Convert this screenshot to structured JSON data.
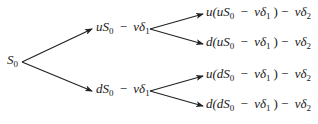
{
  "diagram": {
    "type": "binomial-tree",
    "root": {
      "label": "S0",
      "parts": [
        "S",
        "0"
      ]
    },
    "level1": [
      {
        "id": "up",
        "parts": [
          "uS",
          "0",
          " − ",
          "vδ",
          "1"
        ]
      },
      {
        "id": "down",
        "parts": [
          "dS",
          "0",
          " − ",
          "vδ",
          "1"
        ]
      }
    ],
    "level2": [
      {
        "id": "up-up",
        "parts": [
          "u(uS",
          "0",
          " − ",
          "vδ",
          "1",
          ") − ",
          "vδ",
          "2"
        ]
      },
      {
        "id": "up-down",
        "parts": [
          "d(uS",
          "0",
          " − ",
          "vδ",
          "1",
          ") − ",
          "vδ",
          "2"
        ]
      },
      {
        "id": "down-up",
        "parts": [
          "u(dS",
          "0",
          " − ",
          "vδ",
          "1",
          ") − ",
          "vδ",
          "2"
        ]
      },
      {
        "id": "down-down",
        "parts": [
          "d(dS",
          "0",
          " − ",
          "vδ",
          "1",
          ") − ",
          "vδ",
          "2"
        ]
      }
    ],
    "edge_color": "#222222"
  }
}
